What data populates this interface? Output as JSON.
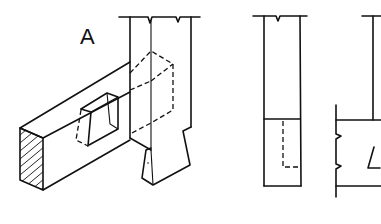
{
  "figure": {
    "type": "technical-drawing",
    "views": [
      {
        "name": "isometric-view",
        "label": "A"
      },
      {
        "name": "front-elevation",
        "label": ""
      },
      {
        "name": "side-elevation",
        "label": ""
      }
    ],
    "label_A": "A",
    "colors": {
      "line": "#111111",
      "background": "#ffffff"
    }
  }
}
